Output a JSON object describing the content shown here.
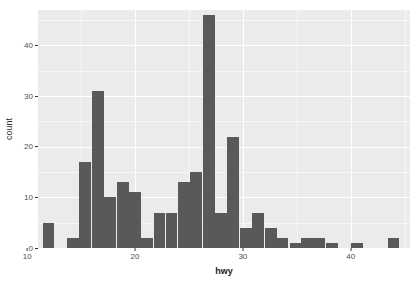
{
  "chart_data": {
    "type": "bar",
    "title": "",
    "subtitle": "",
    "xlabel": "hwy",
    "ylabel": "count",
    "xlim": [
      11.0,
      45.5
    ],
    "ylim": [
      0,
      47
    ],
    "grid": true,
    "legend": "none",
    "binwidth": 1.14,
    "bins": 30,
    "bar_color": "#595959",
    "panel_color": "#EBEBEB",
    "grid_color": "#FFFFFF",
    "x_ticks": [
      10,
      20,
      30,
      40
    ],
    "x_tick_labels": [
      "10",
      "20",
      "30",
      "40"
    ],
    "x_minor_ticks": [
      15,
      25,
      35,
      45
    ],
    "y_ticks": [
      0,
      10,
      20,
      30,
      40
    ],
    "y_tick_labels": [
      "0",
      "10",
      "20",
      "30",
      "40"
    ],
    "y_minor_ticks": [
      5,
      15,
      25,
      35,
      45
    ],
    "x": [
      12.0,
      13.1,
      14.3,
      15.4,
      16.6,
      17.7,
      18.9,
      20.0,
      21.1,
      22.3,
      23.4,
      24.6,
      25.7,
      26.9,
      28.0,
      29.1,
      30.3,
      31.4,
      32.6,
      33.7,
      34.9,
      36.0,
      37.1,
      38.3,
      39.4,
      40.6,
      41.7,
      42.9,
      44.0,
      45.1
    ],
    "values": [
      5,
      0,
      2,
      17,
      31,
      10,
      13,
      11,
      2,
      7,
      7,
      13,
      15,
      46,
      7,
      22,
      4,
      7,
      4,
      2,
      1,
      2,
      2,
      1,
      0,
      1,
      0,
      0,
      2,
      0
    ],
    "categories": [
      "12.0",
      "13.1",
      "14.3",
      "15.4",
      "16.6",
      "17.7",
      "18.9",
      "20.0",
      "21.1",
      "22.3",
      "23.4",
      "24.6",
      "25.7",
      "26.9",
      "28.0",
      "29.1",
      "30.3",
      "31.4",
      "32.6",
      "33.7",
      "34.9",
      "36.0",
      "37.1",
      "38.3",
      "39.4",
      "40.6",
      "41.7",
      "42.9",
      "44.0",
      "45.1"
    ]
  }
}
